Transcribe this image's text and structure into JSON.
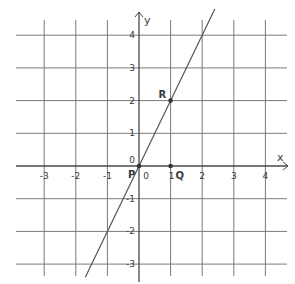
{
  "chart_data": {
    "type": "line",
    "title": "",
    "xlabel": "x",
    "ylabel": "y",
    "xlim": [
      -4,
      4.5
    ],
    "ylim": [
      -3.4,
      4.8
    ],
    "grid": true,
    "x_ticks": [
      -3,
      -2,
      -1,
      0,
      1,
      2,
      3,
      4
    ],
    "y_ticks": [
      -3,
      -2,
      -1,
      0,
      1,
      2,
      3,
      4
    ],
    "x_tick_labels": [
      "-3",
      "-2",
      "-1",
      "0",
      "1",
      "2",
      "3",
      "4"
    ],
    "y_tick_labels": [
      "-3",
      "-2",
      "-1",
      "0",
      "1",
      "2",
      "3",
      "4"
    ],
    "series": [
      {
        "name": "y = 2x",
        "x": [
          -1.7,
          2.4
        ],
        "y": [
          -3.4,
          4.8
        ],
        "slope": 2,
        "intercept": 0
      }
    ],
    "points": [
      {
        "label": "P",
        "x": 0,
        "y": 0
      },
      {
        "label": "Q",
        "x": 1,
        "y": 0
      },
      {
        "label": "R",
        "x": 1,
        "y": 2
      }
    ],
    "annotations": [
      "P",
      "Q",
      "R"
    ]
  },
  "colors": {
    "grid": "#7a7a7a",
    "axis": "#4a4a4a",
    "line": "#555555",
    "point": "#333333",
    "text": "#3a3a3a"
  }
}
